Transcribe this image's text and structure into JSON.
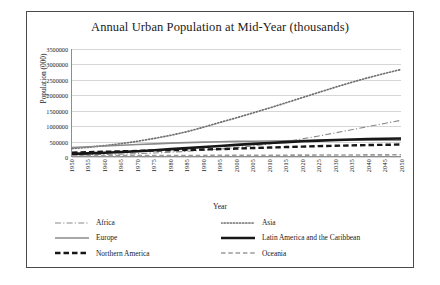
{
  "chart_data": {
    "type": "line",
    "title": "Annual Urban Population at Mid-Year (thousands)",
    "xlabel": "Year",
    "ylabel": "Population (000)",
    "ylim": [
      0,
      3500000
    ],
    "ytick_labels": [
      "3500000",
      "3000000",
      "2500000",
      "2000000",
      "1500000",
      "1000000",
      "500000",
      "0"
    ],
    "ytick_values": [
      3500000,
      3000000,
      2500000,
      2000000,
      1500000,
      1000000,
      500000,
      0
    ],
    "grid": true,
    "legend_position": "bottom",
    "x": [
      1950,
      1955,
      1960,
      1965,
      1970,
      1975,
      1980,
      1985,
      1990,
      1995,
      2000,
      2005,
      2010,
      2015,
      2020,
      2025,
      2030,
      2035,
      2040,
      2045,
      2050
    ],
    "xtick_labels": [
      "1950",
      "1955",
      "1960",
      "1965",
      "1970",
      "1975",
      "1980",
      "1985",
      "1990",
      "1995",
      "2000",
      "2005",
      "2010",
      "2015",
      "2020",
      "2025",
      "2030",
      "2035",
      "2040",
      "2045",
      "2050"
    ],
    "series": [
      {
        "name": "Africa",
        "style": "dash-dot",
        "color": "#8a8a8a",
        "width": 1.1,
        "values": [
          32627,
          40302,
          50082,
          62601,
          78100,
          98400,
          123000,
          153000,
          188000,
          228000,
          274000,
          329000,
          395000,
          472000,
          560000,
          655000,
          756000,
          859000,
          963000,
          1066000,
          1167000
        ]
      },
      {
        "name": "Asia",
        "style": "dotted",
        "color": "#707070",
        "width": 1.7,
        "values": [
          244000,
          285000,
          341000,
          405000,
          483000,
          575000,
          677000,
          797000,
          943000,
          1100000,
          1250000,
          1410000,
          1570000,
          1740000,
          1910000,
          2080000,
          2250000,
          2410000,
          2560000,
          2700000,
          2830000
        ]
      },
      {
        "name": "Europe",
        "style": "solid",
        "color": "#8a8a8a",
        "width": 1.6,
        "values": [
          280000,
          305000,
          328000,
          352000,
          375000,
          398000,
          420000,
          438000,
          455000,
          468000,
          478000,
          485000,
          492000,
          498000,
          503000,
          508000,
          512000,
          515000,
          517000,
          518000,
          518000
        ]
      },
      {
        "name": "Latin America and the Caribbean",
        "style": "solid",
        "color": "#171717",
        "width": 2.6,
        "values": [
          69000,
          85000,
          106000,
          130000,
          158000,
          190000,
          224000,
          258000,
          294000,
          330000,
          364000,
          397000,
          427000,
          455000,
          481000,
          504000,
          524000,
          541000,
          555000,
          566000,
          574000
        ]
      },
      {
        "name": "Northern America",
        "style": "thick-dash",
        "color": "#171717",
        "width": 2.4,
        "values": [
          110000,
          124000,
          139000,
          153000,
          167000,
          180000,
          190000,
          200000,
          212000,
          225000,
          243000,
          260000,
          277000,
          293000,
          308000,
          322000,
          335000,
          347000,
          358000,
          367000,
          375000
        ]
      },
      {
        "name": "Oceania",
        "style": "dashed",
        "color": "#9a9a9a",
        "width": 1.6,
        "values": [
          8000,
          9200,
          10500,
          11800,
          13200,
          14600,
          16000,
          17300,
          18800,
          20300,
          21900,
          23500,
          25200,
          27000,
          28800,
          30600,
          32400,
          34200,
          35900,
          37500,
          39000
        ]
      }
    ]
  }
}
